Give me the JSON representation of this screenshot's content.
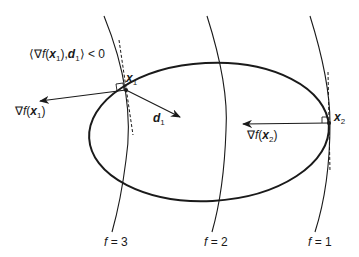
{
  "diagram": {
    "title_annotation": {
      "prefix": "⟨∇",
      "f": "f",
      "open": "(",
      "x": "x",
      "x_sub": "1",
      "close": "),",
      "d": "d",
      "d_sub": "1",
      "suffix": "⟩ < 0"
    },
    "points": {
      "x1": {
        "name": "x",
        "sub": "1"
      },
      "x2": {
        "name": "x",
        "sub": "2"
      }
    },
    "vectors": {
      "grad_x1": {
        "nabla": "∇",
        "f": "f",
        "open": "(",
        "x": "x",
        "sub": "1",
        "close": ")"
      },
      "grad_x2": {
        "nabla": "∇",
        "f": "f",
        "open": "(",
        "x": "x",
        "sub": "2",
        "close": ")"
      },
      "d1": {
        "name": "d",
        "sub": "1"
      }
    },
    "level_sets": [
      {
        "f": "f",
        "eq": " = 3"
      },
      {
        "f": "f",
        "eq": " = 2"
      },
      {
        "f": "f",
        "eq": " = 1"
      }
    ],
    "colors": {
      "stroke": "#1a1a1a",
      "background": "#ffffff"
    }
  }
}
